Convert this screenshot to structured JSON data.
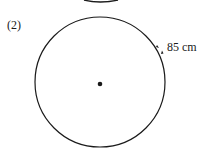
{
  "problem": {
    "number": "(2)",
    "arc_length_label": "85 cm"
  },
  "colors": {
    "stroke": "#1a1a1a",
    "background": "#ffffff"
  }
}
